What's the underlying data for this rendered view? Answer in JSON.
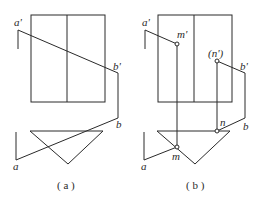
{
  "figure_a": {
    "caption": "( a )",
    "labels": {
      "a_prime": "a'",
      "b_prime": "b'",
      "b": "b",
      "a": "a"
    }
  },
  "figure_b": {
    "caption": "( b )",
    "labels": {
      "a_prime": "a'",
      "m_prime": "m'",
      "n_prime": "(n')",
      "b_prime": "b'",
      "n": "n",
      "b": "b",
      "m": "m",
      "a": "a"
    }
  }
}
